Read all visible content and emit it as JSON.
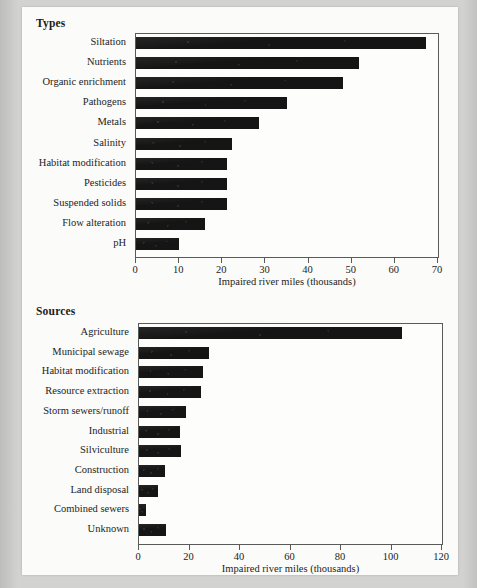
{
  "page": {
    "background_color": "#fbfbf9",
    "border_color": "#c9c9c7"
  },
  "figures": [
    {
      "id": "types",
      "title": "Types",
      "chart_data": {
        "type": "bar",
        "orientation": "horizontal",
        "title": "Types",
        "xlabel": "Impaired river miles (thousands)",
        "ylabel": "",
        "xlim": [
          0,
          70
        ],
        "xticks": [
          0,
          10,
          20,
          30,
          40,
          50,
          60,
          70
        ],
        "grid": false,
        "legend": false,
        "bar_color": "#151515",
        "categories": [
          "Siltation",
          "Nutrients",
          "Organic enrichment",
          "Pathogens",
          "Metals",
          "Salinity",
          "Habitat modification",
          "Pesticides",
          "Suspended solids",
          "Flow alteration",
          "pH"
        ],
        "values": [
          67.2,
          51.8,
          47.9,
          35.0,
          28.5,
          22.3,
          21.0,
          21.0,
          21.2,
          15.9,
          9.9
        ]
      }
    },
    {
      "id": "sources",
      "title": "Sources",
      "chart_data": {
        "type": "bar",
        "orientation": "horizontal",
        "title": "Sources",
        "xlabel": "Impaired river miles (thousands)",
        "ylabel": "",
        "xlim": [
          0,
          120
        ],
        "xticks": [
          0,
          20,
          40,
          60,
          80,
          100,
          120
        ],
        "grid": false,
        "legend": false,
        "bar_color": "#151515",
        "categories": [
          "Agriculture",
          "Municipal sewage",
          "Habitat modification",
          "Resource extraction",
          "Storm sewers/runoff",
          "Industrial",
          "Silviculture",
          "Construction",
          "Land disposal",
          "Combined sewers",
          "Unknown"
        ],
        "values": [
          104.3,
          27.9,
          25.2,
          24.4,
          18.5,
          16.1,
          16.5,
          10.2,
          7.5,
          2.8,
          10.6
        ]
      }
    }
  ]
}
